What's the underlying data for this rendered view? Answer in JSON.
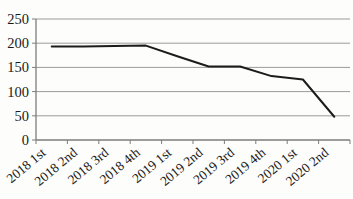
{
  "figure": {
    "background": "#fdfdfb"
  },
  "chart_data": {
    "type": "line",
    "title": "",
    "categories": [
      "2018 1st",
      "2018 2nd",
      "2018 3rd",
      "2018 4th",
      "2019 1st",
      "2019 2nd",
      "2019 3rd",
      "2019 4th",
      "2020 1st",
      "2020 2nd"
    ],
    "values": [
      193,
      193,
      194,
      195,
      173,
      152,
      152,
      132,
      125,
      48
    ],
    "xlabel": "",
    "ylabel": "",
    "ylim": [
      0,
      250
    ],
    "yticks": [
      0,
      50,
      100,
      150,
      200,
      250
    ],
    "grid": true,
    "legend": "none",
    "colors": {
      "line": "#1c1c1c",
      "gridline": "#9b9b9b",
      "axis": "#7d7d7d",
      "text": "#1a1a1a"
    }
  }
}
